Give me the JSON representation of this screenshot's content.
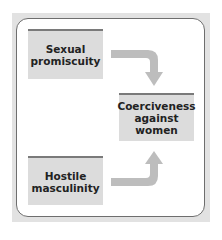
{
  "diagram": {
    "nodes": [
      {
        "id": "sexual",
        "label": "Sexual\npromiscuity"
      },
      {
        "id": "hostile",
        "label": "Hostile\nmasculinity"
      },
      {
        "id": "coerciveness",
        "label": "Coerciveness\nagainst\nwomen"
      }
    ],
    "edges": [
      {
        "from": "sexual",
        "to": "coerciveness"
      },
      {
        "from": "hostile",
        "to": "coerciveness"
      }
    ],
    "colors": {
      "frame": "#e2e2e2",
      "node_fill": "#dcdcdc",
      "node_top_border": "#7a7a7a",
      "arrow": "#bdbdbd"
    }
  }
}
